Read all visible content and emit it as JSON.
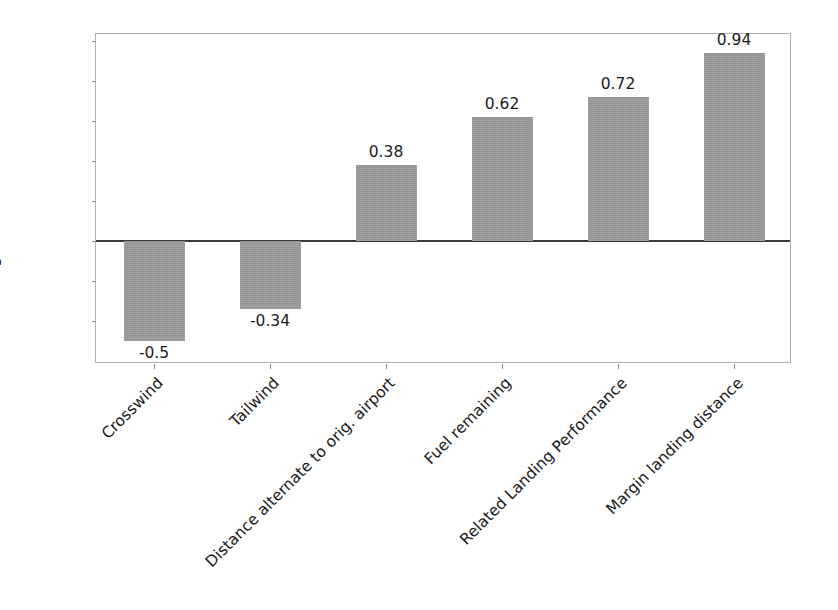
{
  "chart_data": {
    "type": "bar",
    "title": "",
    "xlabel": "",
    "ylabel": "Averaged Correlation with Score",
    "categories": [
      "Crosswind",
      "Tailwind",
      "Distance alternate to orig. airport",
      "Fuel remaining",
      "Related Landing Performance",
      "Margin landing distance"
    ],
    "values": [
      -0.5,
      -0.34,
      0.38,
      0.62,
      0.72,
      0.94
    ],
    "value_labels": [
      "-0.5",
      "-0.34",
      "0.38",
      "0.62",
      "0.72",
      "0.94"
    ],
    "ylim": [
      -0.65,
      1.05
    ],
    "yticks": [
      -0.4,
      -0.2,
      0.0,
      0.2,
      0.4,
      0.6,
      0.8,
      1.0
    ],
    "ytick_labels": [
      "−0.4",
      "−0.2",
      "0.0",
      "0.2",
      "0.4",
      "0.6",
      "0.8",
      "1.0"
    ],
    "grid": false,
    "legend": null,
    "bar_color": "#9b9b9b",
    "zero_line_color": "#3a3a3a",
    "axis_color": "#b0b0b0",
    "text_color": "#1a1a1a",
    "background": "#ffffff",
    "xtick_rotation_deg": -45
  }
}
